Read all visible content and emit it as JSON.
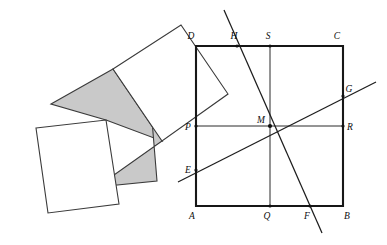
{
  "figure": {
    "background_color": "#ffffff",
    "stroke_color": "#171717",
    "gray_fill": "#c9c9c9",
    "white_fill": "#ffffff",
    "left_panel": {
      "name": "tilted-squares-panel",
      "shapes": [
        {
          "id": "upper-white-square",
          "fill": "white",
          "points": "113,69 181,25 227,95 160,140"
        },
        {
          "id": "lower-white-square",
          "fill": "white",
          "points": "36,128 106,120 118,203 48,212"
        },
        {
          "id": "left-gray-quad",
          "fill": "gray",
          "points": "51,104 113,69 160,140 106,120"
        },
        {
          "id": "right-gray-quad",
          "fill": "gray",
          "points": "160,140 148,97 155,180 96,186"
        }
      ]
    },
    "right_panel": {
      "name": "square-with-cevians-panel",
      "square": {
        "id": "square-ABCD",
        "corners": [
          {
            "label": "A",
            "x": 196,
            "y": 206
          },
          {
            "label": "B",
            "x": 343,
            "y": 206
          },
          {
            "label": "C",
            "x": 343,
            "y": 46
          },
          {
            "label": "D",
            "x": 196,
            "y": 46
          }
        ]
      },
      "midlines": [
        {
          "id": "horizontal-midline-PR",
          "from": "P",
          "to": "R"
        },
        {
          "id": "vertical-midline-SQ",
          "from": "S",
          "to": "Q"
        }
      ],
      "transversals": [
        {
          "id": "line-EG",
          "from": "E",
          "to": "G",
          "description": "shallow rising line through center M"
        },
        {
          "id": "line-HF",
          "from": "H",
          "to": "F",
          "description": "steep descending line through center M"
        }
      ],
      "points": [
        {
          "label": "A",
          "x": 196,
          "y": 206,
          "label_x": 190,
          "label_y": 218,
          "dot": false
        },
        {
          "label": "B",
          "x": 343,
          "y": 206,
          "label_x": 345,
          "label_y": 218,
          "dot": false
        },
        {
          "label": "C",
          "x": 343,
          "y": 46,
          "label_x": 336,
          "label_y": 39,
          "dot": false
        },
        {
          "label": "D",
          "x": 196,
          "y": 46,
          "label_x": 191,
          "label_y": 39,
          "dot": false
        },
        {
          "label": "P",
          "x": 196,
          "y": 126,
          "label_x": 185,
          "label_y": 129,
          "dot": true
        },
        {
          "label": "R",
          "x": 343,
          "y": 126,
          "label_x": 346,
          "label_y": 129,
          "dot": true
        },
        {
          "label": "S",
          "x": 270,
          "y": 46,
          "label_x": 266,
          "label_y": 39,
          "dot": true
        },
        {
          "label": "Q",
          "x": 270,
          "y": 206,
          "label_x": 265,
          "label_y": 218,
          "dot": true
        },
        {
          "label": "M",
          "x": 270,
          "y": 126,
          "label_x": 258,
          "label_y": 123,
          "dot": true
        },
        {
          "label": "E",
          "x": 196,
          "y": 170,
          "label_x": 185,
          "label_y": 173,
          "dot": true
        },
        {
          "label": "G",
          "x": 343,
          "y": 96,
          "label_x": 346,
          "label_y": 92,
          "dot": true
        },
        {
          "label": "H",
          "x": 237,
          "y": 46,
          "label_x": 233,
          "label_y": 39,
          "dot": true
        },
        {
          "label": "F",
          "x": 310,
          "y": 206,
          "label_x": 305,
          "label_y": 218,
          "dot": true
        }
      ],
      "line_endpoints": {
        "EG_extended": {
          "x1": 178,
          "y1": 182,
          "x2": 376,
          "y2": 82
        },
        "HF_extended": {
          "x1": 224,
          "y1": 10,
          "x2": 322,
          "y2": 233
        }
      }
    }
  }
}
